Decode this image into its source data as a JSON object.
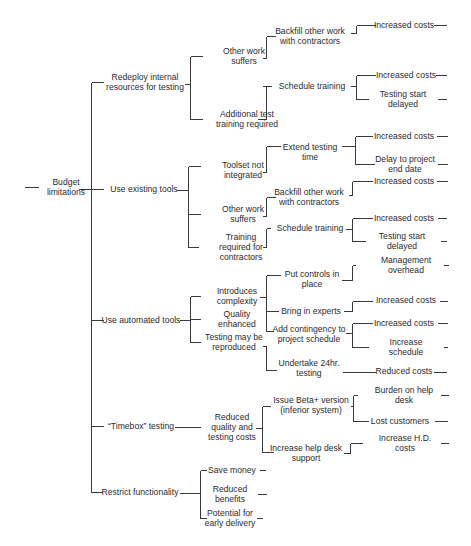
{
  "diagram": {
    "root": {
      "id": "root",
      "label": "Budget\nlimitations",
      "x": 66,
      "y": 187
    },
    "nodes": [
      {
        "id": "n1",
        "label": "Redeploy internal\nresources for testing",
        "x": 145,
        "y": 82
      },
      {
        "id": "n1a",
        "label": "Other work\nsuffers",
        "x": 244,
        "y": 56
      },
      {
        "id": "n1a1",
        "label": "Backfill other work\nwith contractors",
        "x": 310,
        "y": 36
      },
      {
        "id": "n1a1a",
        "label": "Increased costs",
        "x": 404,
        "y": 25
      },
      {
        "id": "n1b",
        "label": "Additional test\ntraining required",
        "x": 247,
        "y": 119
      },
      {
        "id": "n1b1",
        "label": "Schedule training",
        "x": 312,
        "y": 86
      },
      {
        "id": "n1b1a",
        "label": "Increased costs",
        "x": 406,
        "y": 75
      },
      {
        "id": "n1b1b",
        "label": "Testing start delayed",
        "x": 403,
        "y": 99
      },
      {
        "id": "n2",
        "label": "Use existing tools",
        "x": 144,
        "y": 189
      },
      {
        "id": "n2a",
        "label": "Toolset not\nintegrated",
        "x": 243,
        "y": 170
      },
      {
        "id": "n2a1",
        "label": "Extend testing\ntime",
        "x": 310,
        "y": 152
      },
      {
        "id": "n2a1a",
        "label": "Increased costs",
        "x": 404,
        "y": 136
      },
      {
        "id": "n2a1b",
        "label": "Delay to project\nend date",
        "x": 405,
        "y": 164
      },
      {
        "id": "n2b",
        "label": "Other work\nsuffers",
        "x": 243,
        "y": 214
      },
      {
        "id": "n2b1",
        "label": "Backfill other work\nwith contractors",
        "x": 309,
        "y": 197
      },
      {
        "id": "n2b1a",
        "label": "Increased costs",
        "x": 404,
        "y": 181
      },
      {
        "id": "n2b2",
        "label": "Schedule training",
        "x": 310,
        "y": 228
      },
      {
        "id": "n2b2a",
        "label": "Increased costs",
        "x": 404,
        "y": 218
      },
      {
        "id": "n2b2b",
        "label": "Testing start delayed",
        "x": 402,
        "y": 241
      },
      {
        "id": "n2c",
        "label": "Training\nrequired for\ncontractors",
        "x": 241,
        "y": 247
      },
      {
        "id": "n3",
        "label": "Use automated tools",
        "x": 141,
        "y": 320
      },
      {
        "id": "n3a",
        "label": "Introduces\ncomplexity",
        "x": 237,
        "y": 296
      },
      {
        "id": "n3b",
        "label": "Quality\nenhanced",
        "x": 237,
        "y": 319
      },
      {
        "id": "n3c",
        "label": "Testing may be\nreproduced",
        "x": 234,
        "y": 342
      },
      {
        "id": "n3a1",
        "label": "Put controls in\nplace",
        "x": 312,
        "y": 279
      },
      {
        "id": "n3a1a",
        "label": "Management overhead",
        "x": 406,
        "y": 265
      },
      {
        "id": "n3a2",
        "label": "Bring in experts",
        "x": 311,
        "y": 311
      },
      {
        "id": "n3a2a",
        "label": "Increased costs",
        "x": 406,
        "y": 300
      },
      {
        "id": "n3a3",
        "label": "Add contingency to\nproject schedule",
        "x": 309,
        "y": 334
      },
      {
        "id": "n3a3a",
        "label": "Increased costs",
        "x": 404,
        "y": 323
      },
      {
        "id": "n3a3b",
        "label": "Increase schedule",
        "x": 406,
        "y": 347
      },
      {
        "id": "n3c1",
        "label": "Undertake 24hr.\ntesting",
        "x": 309,
        "y": 368
      },
      {
        "id": "n3c1a",
        "label": "Reduced costs",
        "x": 404,
        "y": 371
      },
      {
        "id": "n4",
        "label": "“Timebox” testing",
        "x": 141,
        "y": 426
      },
      {
        "id": "n4a",
        "label": "Reduced\nquality and\ntesting costs",
        "x": 232,
        "y": 427
      },
      {
        "id": "n4a1",
        "label": "Issue Beta+ version\n(inferior system)",
        "x": 311,
        "y": 405
      },
      {
        "id": "n4a1a",
        "label": "Burden on help desk",
        "x": 404,
        "y": 395
      },
      {
        "id": "n4a1b",
        "label": "Lost customers",
        "x": 400,
        "y": 421
      },
      {
        "id": "n4a2",
        "label": "Increase help desk\nsupport",
        "x": 306,
        "y": 453
      },
      {
        "id": "n4a2a",
        "label": "Increase H.D. costs",
        "x": 405,
        "y": 443
      },
      {
        "id": "n5",
        "label": "Restrict functionality",
        "x": 140,
        "y": 492
      },
      {
        "id": "n5a",
        "label": "Save money",
        "x": 232,
        "y": 470
      },
      {
        "id": "n5b",
        "label": "Reduced\nbenefits",
        "x": 230,
        "y": 494
      },
      {
        "id": "n5c",
        "label": "Potential for\nearly delivery",
        "x": 230,
        "y": 518
      }
    ],
    "lines": [
      [
        24,
        187,
        38,
        187
      ],
      [
        78,
        189,
        91,
        189
      ],
      [
        91,
        82,
        91,
        492
      ],
      [
        91,
        82,
        103,
        82
      ],
      [
        91,
        189,
        103,
        189
      ],
      [
        91,
        320,
        103,
        320
      ],
      [
        91,
        426,
        103,
        426
      ],
      [
        91,
        492,
        102,
        492
      ],
      [
        184,
        84,
        190,
        84
      ],
      [
        190,
        56,
        190,
        119
      ],
      [
        190,
        56,
        202,
        56
      ],
      [
        190,
        119,
        202,
        119
      ],
      [
        262,
        58,
        266,
        58
      ],
      [
        266,
        36,
        266,
        58
      ],
      [
        266,
        36,
        275,
        36
      ],
      [
        350,
        33,
        356,
        33
      ],
      [
        356,
        25,
        356,
        33
      ],
      [
        356,
        25,
        375,
        25
      ],
      [
        433,
        25,
        446,
        25
      ],
      [
        262,
        86,
        266,
        86
      ],
      [
        266,
        86,
        266,
        119
      ],
      [
        266,
        119,
        257,
        119
      ],
      [
        266,
        86,
        271,
        86
      ],
      [
        350,
        86,
        356,
        86
      ],
      [
        356,
        75,
        356,
        99
      ],
      [
        356,
        75,
        375,
        75
      ],
      [
        356,
        99,
        368,
        99
      ],
      [
        435,
        75,
        446,
        75
      ],
      [
        437,
        99,
        446,
        99
      ],
      [
        176,
        190,
        188,
        190
      ],
      [
        188,
        166,
        188,
        247
      ],
      [
        188,
        166,
        200,
        166
      ],
      [
        188,
        214,
        200,
        214
      ],
      [
        188,
        247,
        198,
        247
      ],
      [
        262,
        172,
        266,
        172
      ],
      [
        266,
        146,
        266,
        172
      ],
      [
        266,
        146,
        280,
        146
      ],
      [
        341,
        146,
        355,
        146
      ],
      [
        355,
        136,
        355,
        164
      ],
      [
        355,
        136,
        372,
        136
      ],
      [
        355,
        164,
        374,
        164
      ],
      [
        436,
        136,
        447,
        136
      ],
      [
        437,
        164,
        447,
        164
      ],
      [
        262,
        216,
        266,
        216
      ],
      [
        266,
        197,
        266,
        216
      ],
      [
        266,
        197,
        275,
        197
      ],
      [
        348,
        195,
        352,
        195
      ],
      [
        352,
        181,
        352,
        195
      ],
      [
        352,
        181,
        372,
        181
      ],
      [
        436,
        181,
        447,
        181
      ],
      [
        262,
        247,
        266,
        247
      ],
      [
        266,
        228,
        266,
        247
      ],
      [
        266,
        228,
        270,
        228
      ],
      [
        345,
        229,
        352,
        229
      ],
      [
        352,
        218,
        352,
        241
      ],
      [
        352,
        218,
        372,
        218
      ],
      [
        352,
        241,
        365,
        241
      ],
      [
        437,
        218,
        446,
        218
      ],
      [
        440,
        241,
        446,
        241
      ],
      [
        179,
        320,
        190,
        320
      ],
      [
        190,
        296,
        190,
        342
      ],
      [
        190,
        296,
        200,
        296
      ],
      [
        190,
        319,
        200,
        319
      ],
      [
        190,
        342,
        200,
        342
      ],
      [
        259,
        297,
        266,
        297
      ],
      [
        266,
        275,
        266,
        331
      ],
      [
        266,
        275,
        280,
        275
      ],
      [
        266,
        311,
        278,
        311
      ],
      [
        266,
        331,
        273,
        331
      ],
      [
        341,
        280,
        352,
        280
      ],
      [
        352,
        265,
        352,
        280
      ],
      [
        352,
        265,
        355,
        265
      ],
      [
        443,
        265,
        448,
        265
      ],
      [
        343,
        311,
        352,
        311
      ],
      [
        352,
        301,
        352,
        311
      ],
      [
        352,
        301,
        372,
        301
      ],
      [
        439,
        301,
        447,
        301
      ],
      [
        345,
        333,
        352,
        333
      ],
      [
        352,
        323,
        352,
        347
      ],
      [
        352,
        323,
        372,
        323
      ],
      [
        352,
        347,
        368,
        347
      ],
      [
        437,
        323,
        447,
        323
      ],
      [
        443,
        347,
        447,
        347
      ],
      [
        262,
        346,
        266,
        346
      ],
      [
        266,
        346,
        266,
        370
      ],
      [
        266,
        370,
        276,
        370
      ],
      [
        342,
        372,
        375,
        372
      ],
      [
        433,
        372,
        446,
        372
      ],
      [
        174,
        427,
        200,
        427
      ],
      [
        255,
        428,
        262,
        428
      ],
      [
        262,
        406,
        262,
        452
      ],
      [
        262,
        406,
        270,
        406
      ],
      [
        262,
        452,
        273,
        452
      ],
      [
        350,
        406,
        353,
        406
      ],
      [
        353,
        395,
        353,
        421
      ],
      [
        353,
        395,
        357,
        395
      ],
      [
        353,
        421,
        368,
        421
      ],
      [
        440,
        395,
        448,
        395
      ],
      [
        434,
        421,
        447,
        421
      ],
      [
        343,
        453,
        350,
        453
      ],
      [
        350,
        443,
        350,
        453
      ],
      [
        350,
        443,
        362,
        443
      ],
      [
        440,
        443,
        448,
        443
      ],
      [
        179,
        493,
        200,
        493
      ],
      [
        200,
        470,
        200,
        518
      ],
      [
        200,
        470,
        206,
        470
      ],
      [
        200,
        518,
        206,
        518
      ],
      [
        190,
        493,
        200,
        493
      ],
      [
        259,
        470,
        265,
        470
      ],
      [
        257,
        494,
        266,
        494
      ],
      [
        256,
        518,
        262,
        518
      ]
    ],
    "caption_visible_fragment": ""
  }
}
